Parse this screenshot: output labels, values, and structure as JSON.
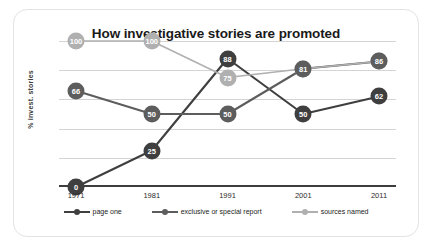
{
  "chart_data": {
    "type": "line",
    "title": "How investigative stories are promoted",
    "xlabel": "",
    "ylabel": "% invest. stories",
    "categories": [
      "1971",
      "1981",
      "1991",
      "2001",
      "2011"
    ],
    "ylim": [
      0,
      100
    ],
    "grid": true,
    "gridline_values": [
      0,
      20,
      40,
      60,
      80,
      100
    ],
    "legend_position": "bottom",
    "series": [
      {
        "name": "page one",
        "color": "#3f3f3f",
        "values": [
          0,
          25,
          88,
          50,
          62
        ],
        "labels": [
          "0",
          "25",
          "88",
          "50",
          "62"
        ]
      },
      {
        "name": "exclusive or special report",
        "color": "#5d5d5d",
        "values": [
          66,
          50,
          50,
          81,
          86
        ],
        "labels": [
          "66",
          "50",
          "50",
          "81",
          "86"
        ]
      },
      {
        "name": "sources named",
        "color": "#b0b0b0",
        "values": [
          100,
          100,
          75,
          81,
          86
        ],
        "labels": [
          "100",
          "100",
          "75",
          "81",
          "86"
        ]
      }
    ]
  },
  "ticks": {
    "x": [
      "1971",
      "1981",
      "1991",
      "2001",
      "2011"
    ]
  },
  "legend": {
    "items": [
      {
        "label": "page one",
        "color": "#3f3f3f"
      },
      {
        "label": "exclusive or special report",
        "color": "#5d5d5d"
      },
      {
        "label": "sources named",
        "color": "#b0b0b0"
      }
    ]
  }
}
